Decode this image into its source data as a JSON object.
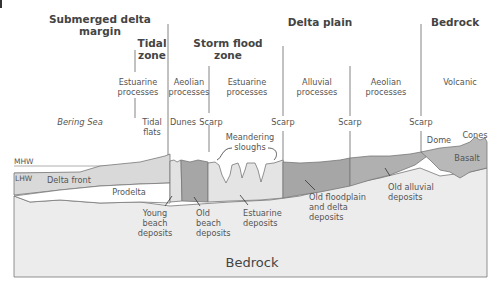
{
  "headings": {
    "submerged": "Submerged delta",
    "submerged2": "margin",
    "delta_plain": "Delta plain",
    "bedrock": "Bedrock",
    "tidal": "Tidal",
    "tidal2": "zone",
    "storm": "Storm flood",
    "storm2": "zone"
  },
  "processes": {
    "estuarine1": "Estuarine",
    "estuarine1b": "processes",
    "aeolian1": "Aeolian",
    "aeolian1b": "processes",
    "estuarine2": "Estuarine",
    "estuarine2b": "processes",
    "alluvial": "Alluvial",
    "alluvialb": "processes",
    "aeolian2": "Aeolian",
    "aeolian2b": "processes",
    "volcanic": "Volcanic"
  },
  "features": {
    "bering_sea": "Bering Sea",
    "tidal_flats": "Tidal",
    "tidal_flats2": "flats",
    "dunes": "Dunes",
    "scarp1": "Scarp",
    "scarp2": "Scarp",
    "scarp3": "Scarp",
    "scarp4": "Scarp",
    "meandering": "Meandering",
    "sloughs": "sloughs",
    "dome": "Dome",
    "cones": "Cones"
  },
  "water_levels": {
    "mhw": "MHW",
    "lhw": "LHW"
  },
  "units": {
    "delta_front": "Delta front",
    "prodelta": "Prodelta",
    "basalt": "Basalt",
    "bedrock": "Bedrock"
  },
  "deposits": {
    "young": [
      "Young",
      "beach",
      "deposits"
    ],
    "old_beach": [
      "Old",
      "beach",
      "deposits"
    ],
    "estuarine": [
      "Estuarine",
      "deposits"
    ],
    "floodplain": [
      "Old floodplain",
      "and delta",
      "deposits"
    ],
    "alluvial": [
      "Old alluvial",
      "deposits"
    ]
  },
  "colors": {
    "bedrock_fill": "#ececec",
    "light_fill": "#e2e2e2",
    "dark_fill": "#a6a6a6",
    "medium_fill": "#b8b8b8",
    "delta_front_fill": "#d9d9d9",
    "line": "#666666"
  }
}
